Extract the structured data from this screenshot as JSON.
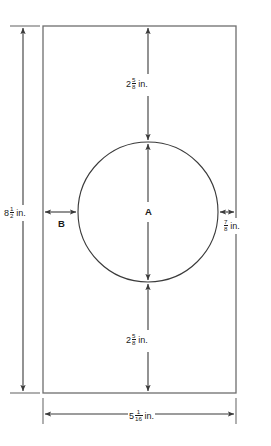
{
  "diagram": {
    "shape": {
      "outline": "rectangle",
      "hole": "circle"
    },
    "dimensions": {
      "height": {
        "whole": "8",
        "numerator": "1",
        "denominator": "2",
        "unit": "in.",
        "full_text": "8 1/2 in.",
        "position": "left"
      },
      "width": {
        "whole": "5",
        "numerator": "1",
        "denominator": "16",
        "unit": "in.",
        "full_text": "5 1/16 in.",
        "position": "bottom"
      },
      "top_gap": {
        "whole": "2",
        "numerator": "5",
        "denominator": "8",
        "unit": "in.",
        "full_text": "2 5/8 in.",
        "position": "top-center"
      },
      "bottom_gap": {
        "whole": "2",
        "numerator": "5",
        "denominator": "8",
        "unit": "in.",
        "full_text": "2 5/8 in.",
        "position": "bottom-center"
      },
      "right_gap": {
        "whole": "",
        "numerator": "7",
        "denominator": "8",
        "unit": "in.",
        "full_text": "7/8 in.",
        "position": "right"
      }
    },
    "unknowns": {
      "diameter_label": "A",
      "left_gap_label": "B"
    },
    "colors": {
      "line": "#3a3a3a",
      "dimension_line": "#4a4a4a",
      "text": "#1a1a1a",
      "background": "#ffffff"
    }
  }
}
